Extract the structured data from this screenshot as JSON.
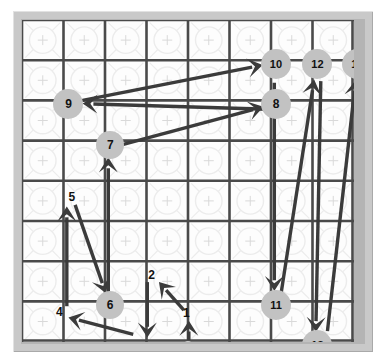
{
  "diagram": {
    "type": "grid-path-diagram",
    "grid": {
      "columns": 8,
      "rows": 8,
      "cell_width": 41.5,
      "cell_height": 40.2,
      "line_color": "#4a4a4a",
      "faint_pattern_color": "#ececec",
      "board_background": "#fdfdfd",
      "frame_color": "#c9c9c9",
      "frame_inner_color": "#b4b4b4"
    },
    "style": {
      "arrow_color": "#3b3b3b",
      "node_fill": "#c2c2c2",
      "node_stroke": "#b0b0b0",
      "node_text_color": "#111111",
      "label_text_color": "#111111",
      "start_dot_fill": "#cfcfcf"
    },
    "start_marker": {
      "name": "start-dot",
      "col": 3.5,
      "row": 7.62,
      "radius": 5
    },
    "nodes": [
      {
        "id": "1",
        "label": "1",
        "col": 3.46,
        "row": 6.82,
        "kind": "label",
        "radius": 0
      },
      {
        "id": "2",
        "label": "2",
        "col": 2.62,
        "row": 5.86,
        "kind": "label",
        "radius": 0
      },
      {
        "id": "3",
        "label": "3",
        "col": 2.6,
        "row": 7.72,
        "kind": "label",
        "radius": 0
      },
      {
        "id": "4",
        "label": "4",
        "col": 0.4,
        "row": 6.8,
        "kind": "label",
        "radius": 0
      },
      {
        "id": "5",
        "label": "5",
        "col": 0.7,
        "row": 3.92,
        "kind": "label",
        "radius": 0
      },
      {
        "id": "6",
        "label": "6",
        "col": 1.62,
        "row": 6.58,
        "kind": "circle",
        "radius": 14
      },
      {
        "id": "7",
        "label": "7",
        "col": 1.63,
        "row": 2.62,
        "kind": "circle",
        "radius": 14
      },
      {
        "id": "8",
        "label": "8",
        "col": 5.62,
        "row": 1.6,
        "kind": "circle",
        "radius": 15
      },
      {
        "id": "9",
        "label": "9",
        "col": 0.62,
        "row": 1.6,
        "kind": "circle",
        "radius": 15
      },
      {
        "id": "10",
        "label": "10",
        "col": 5.62,
        "row": 0.6,
        "kind": "circle",
        "radius": 15
      },
      {
        "id": "11",
        "label": "11",
        "col": 5.62,
        "row": 6.58,
        "kind": "circle",
        "radius": 15
      },
      {
        "id": "12",
        "label": "12",
        "col": 6.62,
        "row": 0.6,
        "kind": "circle",
        "radius": 15
      },
      {
        "id": "13",
        "label": "13",
        "col": 6.62,
        "row": 7.58,
        "kind": "circle",
        "radius": 15
      },
      {
        "id": "14",
        "label": "14",
        "col": 7.58,
        "row": 0.6,
        "kind": "circle",
        "radius": 15
      }
    ],
    "arrows": [
      {
        "name": "arrow-start-to-1",
        "from": [
          3.52,
          7.46
        ],
        "to": [
          3.52,
          6.98
        ]
      },
      {
        "name": "arrow-1-to-2",
        "from": [
          3.4,
          6.72
        ],
        "to": [
          2.8,
          6.02
        ]
      },
      {
        "name": "arrow-2-to-3",
        "from": [
          2.52,
          6.02
        ],
        "to": [
          2.52,
          7.4
        ]
      },
      {
        "name": "arrow-3-to-4",
        "from": [
          2.18,
          7.32
        ],
        "to": [
          0.62,
          6.9
        ]
      },
      {
        "name": "arrow-4-to-5",
        "from": [
          0.58,
          6.62
        ],
        "to": [
          0.58,
          4.14
        ]
      },
      {
        "name": "arrow-5-to-6",
        "from": [
          0.78,
          4.1
        ],
        "to": [
          1.52,
          6.3
        ]
      },
      {
        "name": "arrow-6-to-7",
        "from": [
          1.58,
          6.34
        ],
        "to": [
          1.58,
          2.92
        ]
      },
      {
        "name": "arrow-7-to-8",
        "from": [
          1.92,
          2.6
        ],
        "to": [
          5.32,
          1.66
        ]
      },
      {
        "name": "arrow-8-to-9",
        "from": [
          5.42,
          1.72
        ],
        "to": [
          0.96,
          1.58
        ]
      },
      {
        "name": "arrow-9-to-10",
        "from": [
          0.96,
          1.5
        ],
        "to": [
          5.3,
          0.62
        ]
      },
      {
        "name": "arrow-10-to-11",
        "from": [
          5.58,
          1.06
        ],
        "to": [
          5.58,
          6.24
        ]
      },
      {
        "name": "arrow-11-to-12",
        "from": [
          5.74,
          6.32
        ],
        "to": [
          6.54,
          0.98
        ]
      },
      {
        "name": "arrow-12-to-13",
        "from": [
          6.7,
          1.02
        ],
        "to": [
          6.58,
          7.26
        ]
      },
      {
        "name": "arrow-13-to-14",
        "from": [
          6.86,
          7.24
        ],
        "to": [
          7.54,
          1.0
        ]
      }
    ]
  }
}
